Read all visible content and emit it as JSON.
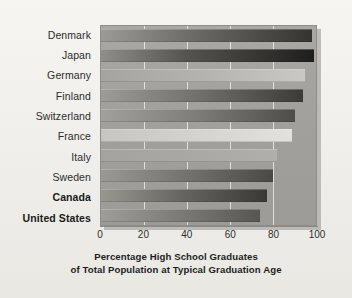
{
  "chart_data": {
    "type": "bar",
    "orientation": "horizontal",
    "title": "",
    "caption_line1": "Percentage High School Graduates",
    "caption_line2": "of Total Population at Typical Graduation Age",
    "xlabel": "",
    "ylabel": "",
    "xlim": [
      0,
      100
    ],
    "ylim": null,
    "grid": true,
    "gridlines_at": [
      20,
      40,
      60,
      80
    ],
    "legend": false,
    "legend_position": "none",
    "xticks": [
      "0",
      "20",
      "40",
      "60",
      "80",
      "100"
    ],
    "xtick_values": [
      0,
      20,
      40,
      60,
      80,
      100
    ],
    "categories": [
      "Denmark",
      "Japan",
      "Germany",
      "Finland",
      "Switzerland",
      "France",
      "Italy",
      "Sweden",
      "Canada",
      "United States"
    ],
    "values": [
      98,
      99,
      95,
      94,
      90,
      89,
      82,
      80,
      77,
      74
    ],
    "emphasized_categories": [
      "Canada",
      "United States"
    ],
    "bars": [
      {
        "label": "Denmark",
        "value": 98,
        "tone": "tone-dark",
        "emphasis": false
      },
      {
        "label": "Japan",
        "value": 99,
        "tone": "tone-darker",
        "emphasis": false
      },
      {
        "label": "Germany",
        "value": 95,
        "tone": "tone-light",
        "emphasis": false
      },
      {
        "label": "Finland",
        "value": 94,
        "tone": "tone-mid",
        "emphasis": false
      },
      {
        "label": "Switzerland",
        "value": 90,
        "tone": "tone-mid2",
        "emphasis": false
      },
      {
        "label": "France",
        "value": 89,
        "tone": "tone-pale",
        "emphasis": false
      },
      {
        "label": "Italy",
        "value": 82,
        "tone": "tone-faint",
        "emphasis": false
      },
      {
        "label": "Sweden",
        "value": 80,
        "tone": "tone-mid3",
        "emphasis": false
      },
      {
        "label": "Canada",
        "value": 77,
        "tone": "tone-mid4",
        "emphasis": true
      },
      {
        "label": "United States",
        "value": 74,
        "tone": "tone-mid5",
        "emphasis": true
      }
    ],
    "colors": {
      "page_background": "#f2f1ee",
      "panel_background": "#a2a19d",
      "panel_shadow": "#b4b2ad",
      "gridline": "#f5f5f2",
      "axis_line": "#8a8985",
      "label_text": "#2c2c2c",
      "caption_text": "#1d1d1d"
    }
  }
}
